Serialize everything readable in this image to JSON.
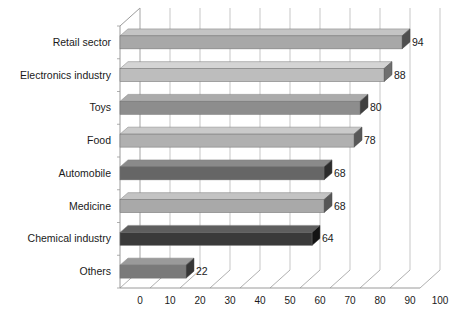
{
  "chart_data": {
    "type": "bar",
    "orientation": "horizontal",
    "title": "",
    "subtitle": "",
    "xlabel": "",
    "ylabel": "",
    "categories": [
      "Retail sector",
      "Electronics industry",
      "Toys",
      "Food",
      "Automobile",
      "Medicine",
      "Chemical industry",
      "Others"
    ],
    "values": [
      94,
      88,
      80,
      78,
      68,
      68,
      64,
      22
    ],
    "value_labels": [
      "94",
      "88",
      "80",
      "78",
      "68",
      "68",
      "64",
      "22"
    ],
    "xlim": [
      0,
      100
    ],
    "xticks": [
      0,
      10,
      20,
      30,
      40,
      50,
      60,
      70,
      80,
      90,
      100
    ],
    "xtick_labels": [
      "0",
      "10",
      "20",
      "30",
      "40",
      "50",
      "60",
      "70",
      "80",
      "90",
      "100"
    ],
    "grid": true,
    "grid_axis": "x",
    "legend": false,
    "legend_position": "none",
    "style": "3d",
    "bar_colors": [
      "#a8a8a8",
      "#bdbdbd",
      "#8d8d8d",
      "#b0b0b0",
      "#666666",
      "#a9a9a9",
      "#3a3a3a",
      "#7a7a7a"
    ],
    "bar_top_colors": [
      "#c4c4c4",
      "#d4d4d4",
      "#ababab",
      "#cacaca",
      "#8a8a8a",
      "#c3c3c3",
      "#5e5e5e",
      "#9a9a9a"
    ],
    "bar_end_colors": [
      "#4f4f4f",
      "#6f6f6f",
      "#3f3f3f",
      "#585858",
      "#2c2c2c",
      "#565656",
      "#141414",
      "#363636"
    ]
  },
  "axes": {
    "background_color": "#ffffff",
    "gridline_color": "#b9b9b9",
    "axis_color": "#8f8f8f"
  }
}
